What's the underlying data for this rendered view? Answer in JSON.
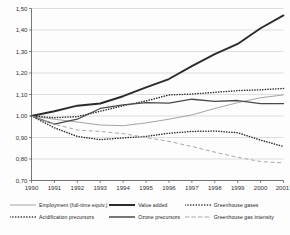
{
  "chart_data": {
    "type": "line",
    "title": "",
    "subtitle": "",
    "xlabel": "",
    "ylabel": "",
    "x": [
      "1990",
      "1991",
      "1992",
      "1993",
      "1994",
      "1995",
      "1996",
      "1997",
      "1998",
      "1999",
      "2000",
      "2001"
    ],
    "xtick_labels": [
      "1990",
      "1991",
      "1992",
      "1993",
      "1994",
      "1995",
      "1996",
      "1997",
      "1998",
      "1999",
      "2000",
      "2001"
    ],
    "last_tick_superscript": "1",
    "ylim": [
      0.7,
      1.5
    ],
    "ytick_labels": [
      "0,70",
      "0,80",
      "0,90",
      "1,00",
      "1,10",
      "1,20",
      "1,30",
      "1,40",
      "1,50"
    ],
    "ytick_values": [
      0.7,
      0.8,
      0.9,
      1.0,
      1.1,
      1.2,
      1.3,
      1.4,
      1.5
    ],
    "grid": true,
    "grid_axis": "y",
    "legend_position": "bottom",
    "index_base_value": 1.0,
    "series": [
      {
        "name": "Employment (full-time equiv.)",
        "style": "solid-thin-gray",
        "color": "#9a9a9a",
        "values": [
          1.0,
          0.985,
          0.972,
          0.958,
          0.955,
          0.968,
          0.985,
          1.005,
          1.035,
          1.062,
          1.085,
          1.098
        ]
      },
      {
        "name": "Value added",
        "style": "solid-thick-dark",
        "color": "#2b2b2b",
        "values": [
          1.0,
          1.022,
          1.048,
          1.058,
          1.092,
          1.133,
          1.172,
          1.232,
          1.288,
          1.335,
          1.408,
          1.468
        ]
      },
      {
        "name": "Greenhouse gases",
        "style": "dotted-dark",
        "color": "#2b2b2b",
        "values": [
          1.0,
          0.992,
          0.997,
          1.022,
          1.048,
          1.07,
          1.098,
          1.102,
          1.11,
          1.118,
          1.122,
          1.128
        ]
      },
      {
        "name": "Acidification precursors",
        "style": "dotted-dark",
        "color": "#2b2b2b",
        "values": [
          1.0,
          0.945,
          0.905,
          0.89,
          0.898,
          0.905,
          0.92,
          0.928,
          0.93,
          0.922,
          0.888,
          0.858
        ]
      },
      {
        "name": "Ozone precursors",
        "style": "solid-medium-dark",
        "color": "#4a4a4a",
        "values": [
          1.0,
          0.962,
          0.985,
          1.035,
          1.052,
          1.062,
          1.06,
          1.078,
          1.068,
          1.072,
          1.058,
          1.058
        ]
      },
      {
        "name": "Greenhouse gas intensity",
        "style": "dashed-gray",
        "color": "#a8a8a8",
        "values": [
          1.0,
          0.962,
          0.935,
          0.928,
          0.918,
          0.9,
          0.882,
          0.858,
          0.832,
          0.808,
          0.788,
          0.782
        ]
      }
    ]
  },
  "legend": {
    "rows": [
      [
        {
          "label": "Employment (full-time equiv.)",
          "style": "solid-thin-gray"
        },
        {
          "label": "Value added",
          "style": "solid-thick-dark"
        },
        {
          "label": "Greenhouse gases",
          "style": "dotted-dark"
        }
      ],
      [
        {
          "label": "Acidification precursors",
          "style": "dotted-dark"
        },
        {
          "label": "Ozone precursors",
          "style": "solid-medium-dark"
        },
        {
          "label": "Greenhouse gas intensity",
          "style": "dashed-gray"
        }
      ]
    ]
  },
  "colors": {
    "axis": "#555555",
    "grid": "#c9c9c9",
    "dark": "#2b2b2b",
    "medium": "#4a4a4a",
    "gray": "#9a9a9a",
    "light_gray": "#a8a8a8",
    "background": "#fdfdfd"
  }
}
